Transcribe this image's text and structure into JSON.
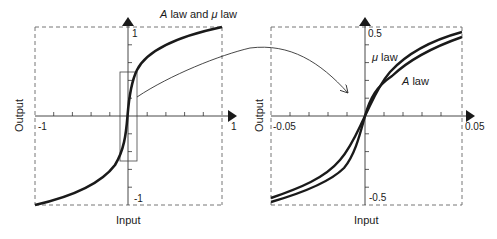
{
  "figure": {
    "left_plot": {
      "title": "A law and μ law",
      "title_italic_part": "A",
      "title_rest": " law and ",
      "title_mu": "μ",
      "title_end": " law",
      "xlabel": "Input",
      "ylabel": "Output",
      "x_ticks": {
        "min": "-1",
        "max": "1"
      },
      "y_ticks": {
        "max": "1",
        "min": "-1"
      },
      "xlim": [
        -1,
        1
      ],
      "ylim": [
        -1,
        1
      ]
    },
    "right_plot": {
      "xlabel": "Input",
      "ylabel": "Output",
      "x_ticks": {
        "min": "-0.05",
        "max": "0.05"
      },
      "y_ticks": {
        "max": "0.5",
        "min": "-0.5"
      },
      "xlim": [
        -0.05,
        0.05
      ],
      "ylim": [
        -0.5,
        0.5
      ],
      "curve_labels": {
        "mu_symbol": "μ",
        "mu_rest": " law",
        "a_symbol": "A",
        "a_rest": " law"
      }
    },
    "annotation": "zoom-in arrow from small-signal region of left plot to right plot",
    "colors": {
      "curve": "#1a1a1a",
      "axis": "#333333",
      "dashed": "#555555"
    }
  }
}
